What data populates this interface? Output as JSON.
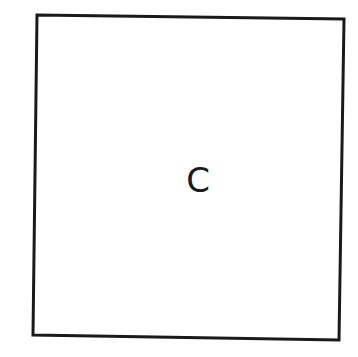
{
  "diagram": {
    "background": "#ffffff",
    "stroke_color": "#1a1a1a",
    "box": {
      "label": "C",
      "corners": {
        "top_left": [
          37,
          15
        ],
        "top_right": [
          344,
          19
        ],
        "bottom_right": [
          339,
          340
        ],
        "bottom_left": [
          33,
          335
        ]
      }
    }
  }
}
